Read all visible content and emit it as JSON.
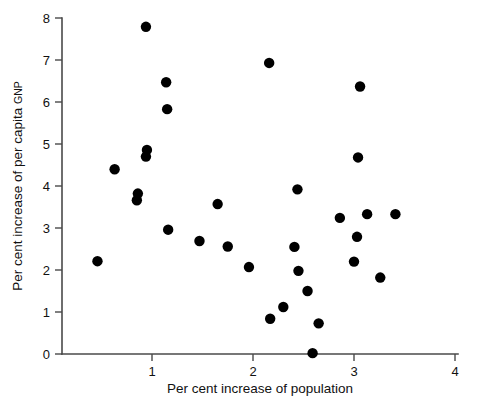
{
  "chart_data": {
    "type": "scatter",
    "title": "",
    "xlabel": "Per cent increase of population",
    "ylabel_main": "Per cent increase of per capita ",
    "ylabel_small": "GNP",
    "ylabel": "Per cent increase of per capita GNP",
    "xlim": [
      0,
      4
    ],
    "ylim": [
      0,
      8
    ],
    "xticks": [
      1,
      2,
      3,
      4
    ],
    "xticklabels": [
      "1",
      "2",
      "3",
      "4"
    ],
    "yticks": [
      0,
      1,
      2,
      3,
      4,
      5,
      6,
      7,
      8
    ],
    "yticklabels": [
      "0",
      "1",
      "2",
      "3",
      "4",
      "5",
      "6",
      "7",
      "8"
    ],
    "grid": false,
    "legend": false,
    "marker": "filled-circle",
    "marker_color": "#000000",
    "marker_size": 5.2,
    "axis_color": "#4a4a4a",
    "background": "#ffffff",
    "n_points": 34,
    "points": [
      {
        "x": 0.46,
        "y": 2.21
      },
      {
        "x": 0.63,
        "y": 4.4
      },
      {
        "x": 0.86,
        "y": 3.82
      },
      {
        "x": 0.85,
        "y": 3.66
      },
      {
        "x": 0.94,
        "y": 7.79
      },
      {
        "x": 0.95,
        "y": 4.86
      },
      {
        "x": 0.94,
        "y": 4.7
      },
      {
        "x": 1.14,
        "y": 6.47
      },
      {
        "x": 1.15,
        "y": 5.83
      },
      {
        "x": 1.16,
        "y": 2.96
      },
      {
        "x": 1.47,
        "y": 2.69
      },
      {
        "x": 1.65,
        "y": 3.57
      },
      {
        "x": 1.75,
        "y": 2.56
      },
      {
        "x": 1.96,
        "y": 2.07
      },
      {
        "x": 2.16,
        "y": 6.93
      },
      {
        "x": 2.17,
        "y": 0.84
      },
      {
        "x": 2.3,
        "y": 1.12
      },
      {
        "x": 2.41,
        "y": 2.55
      },
      {
        "x": 2.44,
        "y": 3.92
      },
      {
        "x": 2.45,
        "y": 1.98
      },
      {
        "x": 2.54,
        "y": 1.5
      },
      {
        "x": 2.59,
        "y": 0.02
      },
      {
        "x": 2.65,
        "y": 0.73
      },
      {
        "x": 2.86,
        "y": 3.24
      },
      {
        "x": 3.0,
        "y": 2.2
      },
      {
        "x": 3.03,
        "y": 2.79
      },
      {
        "x": 3.04,
        "y": 4.68
      },
      {
        "x": 3.06,
        "y": 6.37
      },
      {
        "x": 3.13,
        "y": 3.33
      },
      {
        "x": 3.26,
        "y": 1.82
      },
      {
        "x": 3.41,
        "y": 3.33
      }
    ]
  }
}
